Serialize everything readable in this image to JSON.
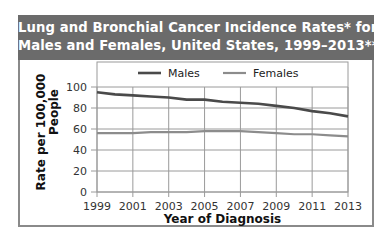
{
  "chart_data": {
    "type": "line",
    "title": "Lung and Bronchial Cancer Incidence Rates* for Males and Females, United States, 1999–2013**",
    "title_lines": [
      "Lung and Bronchial Cancer Incidence Rates* for",
      "Males and Females, United States, 1999–2013**"
    ],
    "xlabel": "Year of Diagnosis",
    "ylabel_lines": [
      "Rate per 100,000",
      "People"
    ],
    "x": [
      1999,
      2000,
      2001,
      2002,
      2003,
      2004,
      2005,
      2006,
      2007,
      2008,
      2009,
      2010,
      2011,
      2012,
      2013
    ],
    "x_ticks": [
      "1999",
      "2001",
      "2003",
      "2005",
      "2007",
      "2009",
      "2011",
      "2013"
    ],
    "y_ticks": [
      "0",
      "20",
      "40",
      "60",
      "80",
      "100"
    ],
    "ylim": [
      0,
      100
    ],
    "grid": true,
    "legend_position": "top",
    "series": [
      {
        "name": "Males",
        "color": "#4a4a4a",
        "values": [
          95,
          93,
          92,
          91,
          90,
          88,
          88,
          86,
          85,
          84,
          82,
          80,
          77,
          75,
          72
        ]
      },
      {
        "name": "Females",
        "color": "#8c8c8c",
        "values": [
          56,
          56,
          56,
          57,
          57,
          57,
          58,
          58,
          58,
          57,
          56,
          55,
          55,
          54,
          53
        ]
      }
    ]
  }
}
